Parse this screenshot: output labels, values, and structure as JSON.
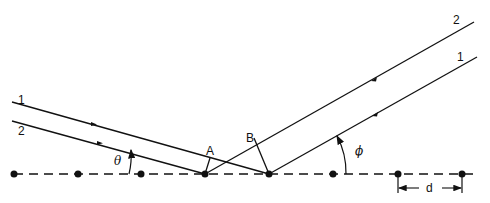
{
  "diagram": {
    "incoming_beams": [
      {
        "label": "1"
      },
      {
        "label": "2"
      }
    ],
    "outgoing_beams": [
      {
        "label": "2"
      },
      {
        "label": "1"
      }
    ],
    "points": {
      "A": "A",
      "B": "B"
    },
    "angles": {
      "incident": "θ",
      "scattered": "ϕ"
    },
    "spacing_label": "d",
    "atom_count": 8,
    "colors": {
      "line": "#111111",
      "background": "#ffffff"
    }
  }
}
